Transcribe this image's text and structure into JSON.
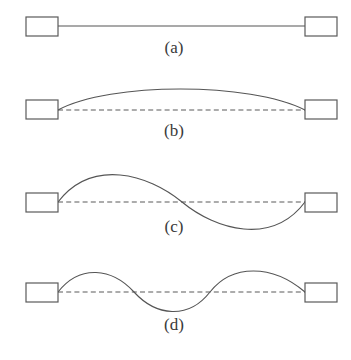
{
  "figure": {
    "width": 351,
    "height": 360,
    "background_color": "#ffffff",
    "stroke_color": "#555555",
    "box_stroke_color": "#5a5a5a",
    "label_color": "#3a3a3a"
  },
  "panels": [
    {
      "id": "a",
      "label": "(a)",
      "label_x": 174,
      "label_y": 53,
      "description": "straight solid line between two boxes",
      "has_dashed_axis": false,
      "baseline_y": 26,
      "left_box": {
        "x": 26,
        "y": 17,
        "width": 32,
        "height": 19
      },
      "right_box": {
        "x": 305,
        "y": 17,
        "width": 32,
        "height": 19
      },
      "curve_path": "M 58 26 L 305 26",
      "dashed_path": ""
    },
    {
      "id": "b",
      "label": "(b)",
      "label_x": 174,
      "label_y": 136,
      "description": "single upward arc over a dashed straight axis",
      "has_dashed_axis": true,
      "baseline_y": 109,
      "left_box": {
        "x": 26,
        "y": 100,
        "width": 32,
        "height": 19
      },
      "right_box": {
        "x": 305,
        "y": 100,
        "width": 32,
        "height": 19
      },
      "curve_path": "M 58 110 C 110 82, 250 82, 305 110",
      "dashed_path": "M 58 110 L 305 110"
    },
    {
      "id": "c",
      "label": "(c)",
      "label_x": 174,
      "label_y": 232,
      "description": "one full sine period: crest then trough, crossing the dashed axis at midpoint",
      "has_dashed_axis": true,
      "baseline_y": 202,
      "left_box": {
        "x": 26,
        "y": 193,
        "width": 32,
        "height": 19
      },
      "right_box": {
        "x": 305,
        "y": 193,
        "width": 32,
        "height": 19
      },
      "curve_path": "M 58 202 C 92 158, 148 174, 182 202 C 216 230, 272 246, 305 202",
      "dashed_path": "M 58 202 L 305 202"
    },
    {
      "id": "d",
      "label": "(d)",
      "label_x": 174,
      "label_y": 330,
      "description": "two sine periods crossing the dashed axis twice",
      "has_dashed_axis": true,
      "baseline_y": 292,
      "left_box": {
        "x": 26,
        "y": 283,
        "width": 32,
        "height": 19
      },
      "right_box": {
        "x": 305,
        "y": 283,
        "width": 32,
        "height": 19
      },
      "curve_path": "M 58 292 C 80 264, 112 268, 134 292 C 156 316, 188 320, 210 292 C 232 264, 272 264, 305 292",
      "dashed_path": "M 58 292 L 305 292"
    }
  ]
}
